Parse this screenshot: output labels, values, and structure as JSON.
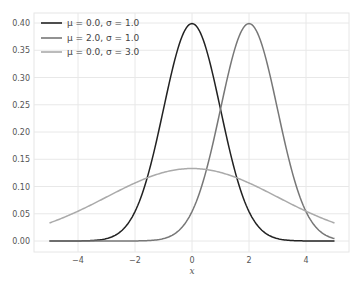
{
  "chart_data": {
    "type": "line",
    "title": "",
    "xlabel": "x",
    "ylabel": "",
    "xlim": [
      -5.3,
      5.3
    ],
    "ylim": [
      -0.017,
      0.418
    ],
    "x_ticks": [
      -4,
      -2,
      0,
      2,
      4
    ],
    "x_tick_labels": [
      "−4",
      "−2",
      "0",
      "2",
      "4"
    ],
    "y_ticks": [
      0.0,
      0.05,
      0.1,
      0.15,
      0.2,
      0.25,
      0.3,
      0.35,
      0.4
    ],
    "y_tick_labels": [
      "0.00",
      "0.05",
      "0.10",
      "0.15",
      "0.20",
      "0.25",
      "0.30",
      "0.35",
      "0.40"
    ],
    "grid": true,
    "legend_position": "upper left",
    "x_range": [
      -5,
      5
    ],
    "series": [
      {
        "name": "μ = 0.0, σ = 1.0",
        "mu": 0.0,
        "sigma": 1.0,
        "color": "#222222",
        "x": [
          -5,
          -4,
          -3,
          -2,
          -1,
          0,
          1,
          2,
          3,
          4,
          5
        ],
        "values": [
          0.0,
          0.0001,
          0.0044,
          0.054,
          0.242,
          0.3989,
          0.242,
          0.054,
          0.0044,
          0.0001,
          0.0
        ]
      },
      {
        "name": "μ = 2.0, σ = 1.0",
        "mu": 2.0,
        "sigma": 1.0,
        "color": "#777777",
        "x": [
          -5,
          -4,
          -3,
          -2,
          -1,
          0,
          1,
          2,
          3,
          4,
          5
        ],
        "values": [
          0.0,
          0.0,
          0.0,
          0.0001,
          0.0044,
          0.054,
          0.242,
          0.3989,
          0.242,
          0.054,
          0.0044
        ]
      },
      {
        "name": "μ = 0.0, σ = 3.0",
        "mu": 0.0,
        "sigma": 3.0,
        "color": "#aaaaaa",
        "x": [
          -5,
          -4,
          -3,
          -2,
          -1,
          0,
          1,
          2,
          3,
          4,
          5
        ],
        "values": [
          0.0332,
          0.0547,
          0.0807,
          0.1065,
          0.1258,
          0.133,
          0.1258,
          0.1065,
          0.0807,
          0.0547,
          0.0332
        ]
      }
    ]
  },
  "legend": {
    "items": [
      {
        "label": "μ = 0.0, σ = 1.0",
        "color": "#222222"
      },
      {
        "label": "μ = 2.0, σ = 1.0",
        "color": "#777777"
      },
      {
        "label": "μ = 0.0, σ = 3.0",
        "color": "#aaaaaa"
      }
    ]
  },
  "axes": {
    "xlabel": "x"
  }
}
